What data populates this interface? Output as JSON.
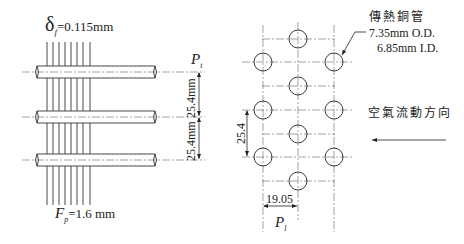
{
  "left_view": {
    "fin_thickness_symbol": "δ",
    "fin_thickness_subscript": "f",
    "fin_thickness_value": "=0.115mm",
    "fin_pitch_symbol": "F",
    "fin_pitch_subscript": "p",
    "fin_pitch_value": "=1.6 mm",
    "transverse_pitch_symbol": "P",
    "transverse_pitch_subscript": "t",
    "pitch_dim_upper": "25.4mm",
    "pitch_dim_lower": "25.4mm",
    "tube_count": 3,
    "fin_count": 8
  },
  "right_view": {
    "tube_label_line1": "傳熱銅管",
    "tube_label_line2": "7.35mm O.D.",
    "tube_label_line3": "6.85mm I.D.",
    "airflow_label": "空氣流動方向",
    "vertical_dim": "25.4",
    "horizontal_dim": "19.05",
    "longitudinal_pitch_symbol": "P",
    "longitudinal_pitch_subscript": "l"
  },
  "colors": {
    "line": "#222222",
    "centerline": "#555555",
    "background": "#ffffff"
  }
}
